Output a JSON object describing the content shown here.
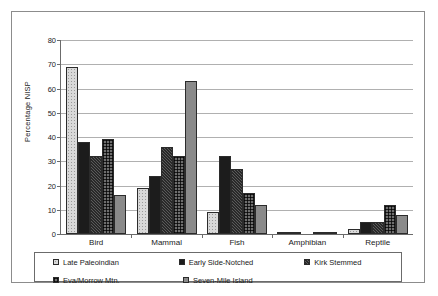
{
  "chart_data": {
    "type": "bar",
    "title": "",
    "xlabel": "",
    "ylabel": "Percentage NISP",
    "ylim": [
      0,
      80
    ],
    "ytick_step": 10,
    "yticks": [
      "80",
      "70",
      "60",
      "50",
      "40",
      "30",
      "20",
      "10",
      "0"
    ],
    "grid": true,
    "legend_position": "bottom",
    "categories": [
      "Bird",
      "Mammal",
      "Fish",
      "Amphibian",
      "Reptile"
    ],
    "series": [
      {
        "name": "Late Paleoindian",
        "key": "s0",
        "values": [
          69,
          19,
          9,
          1,
          2
        ]
      },
      {
        "name": "Early Side-Notched",
        "key": "s1",
        "values": [
          38,
          24,
          32,
          1,
          5
        ]
      },
      {
        "name": "Kirk Stemmed",
        "key": "s2",
        "values": [
          32,
          36,
          27,
          0,
          5
        ]
      },
      {
        "name": "Eva/Morrow Mtn.",
        "key": "s3",
        "values": [
          39,
          32,
          17,
          1,
          12
        ]
      },
      {
        "name": "Seven-Mile Island",
        "key": "s4",
        "values": [
          16,
          63,
          12,
          1,
          8
        ]
      }
    ]
  },
  "legend": {
    "entries": [
      {
        "label": "Late Paleoindian",
        "swatch": "s0"
      },
      {
        "label": "Early Side-Notched",
        "swatch": "s1"
      },
      {
        "label": "Kirk Stemmed",
        "swatch": "s2"
      },
      {
        "label": "Eva/Morrow Mtn.",
        "swatch": "s3"
      },
      {
        "label": "Seven-Mile Island",
        "swatch": "s4"
      }
    ]
  },
  "colors": {
    "axis": "#6b6b6b",
    "gridline": "#b0b0b0",
    "border": "#8c8c8c",
    "text": "#1a1a1a"
  }
}
